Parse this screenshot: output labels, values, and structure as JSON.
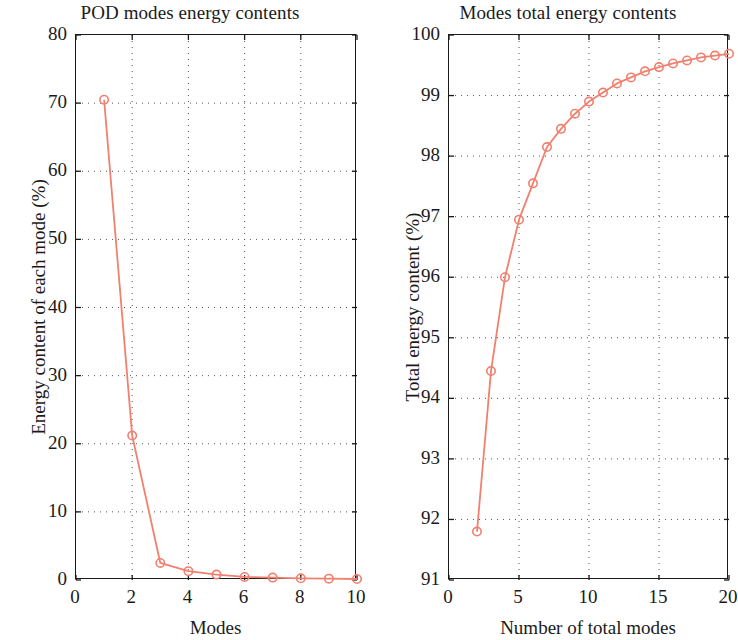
{
  "chart_data": [
    {
      "type": "line",
      "id": "pod-modes-energy-contents",
      "title": "POD modes energy contents",
      "xlabel": "Modes",
      "ylabel": "Energy content of each mode (%)",
      "xlim": [
        0,
        10
      ],
      "ylim": [
        0,
        80
      ],
      "xticks": [
        0,
        2,
        4,
        6,
        8,
        10
      ],
      "yticks": [
        0,
        10,
        20,
        30,
        40,
        50,
        60,
        70,
        80
      ],
      "xtick_labels": [
        "0",
        "2",
        "4",
        "6",
        "8",
        "10"
      ],
      "ytick_labels": [
        "0",
        "10",
        "20",
        "30",
        "40",
        "50",
        "60",
        "70",
        "80"
      ],
      "grid": true,
      "grid_style": "dotted",
      "legend": null,
      "marker": "open-circle",
      "color": "#F08070",
      "x": [
        1,
        2,
        3,
        4,
        5,
        6,
        7,
        8,
        9,
        10
      ],
      "values": [
        70.5,
        21.2,
        2.5,
        1.3,
        0.8,
        0.45,
        0.35,
        0.25,
        0.2,
        0.15
      ]
    },
    {
      "type": "line",
      "id": "modes-total-energy-contents",
      "title": "Modes total energy contents",
      "xlabel": "Number of total modes",
      "ylabel": "Total energy content (%)",
      "xlim": [
        0,
        20
      ],
      "ylim": [
        91,
        100
      ],
      "xticks": [
        0,
        5,
        10,
        15,
        20
      ],
      "yticks": [
        91,
        92,
        93,
        94,
        95,
        96,
        97,
        98,
        99,
        100
      ],
      "xtick_labels": [
        "0",
        "5",
        "10",
        "15",
        "20"
      ],
      "ytick_labels": [
        "91",
        "92",
        "93",
        "94",
        "95",
        "96",
        "97",
        "98",
        "99",
        "100"
      ],
      "grid": true,
      "grid_style": "dotted",
      "legend": null,
      "marker": "open-circle",
      "color": "#F08070",
      "x": [
        2,
        3,
        4,
        5,
        6,
        7,
        8,
        9,
        10,
        11,
        12,
        13,
        14,
        15,
        16,
        17,
        18,
        19,
        20
      ],
      "values": [
        91.8,
        94.45,
        96.0,
        96.95,
        97.55,
        98.15,
        98.45,
        98.7,
        98.9,
        99.05,
        99.2,
        99.3,
        99.4,
        99.47,
        99.53,
        99.58,
        99.63,
        99.66,
        99.69
      ]
    }
  ]
}
